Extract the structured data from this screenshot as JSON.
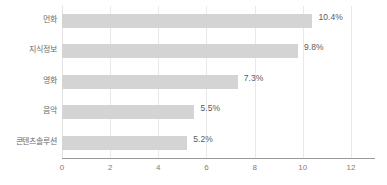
{
  "chart_data": {
    "type": "bar",
    "orientation": "horizontal",
    "title": "",
    "subtitle": "",
    "xlabel": "",
    "ylabel": "",
    "categories": [
      "먼화",
      "지식정보",
      "영화",
      "음악",
      "콘텐츠솔루션"
    ],
    "values": [
      10.4,
      9.8,
      7.3,
      5.5,
      5.2
    ],
    "data_labels": [
      "10.4%",
      "9.8%",
      "7.3%",
      "5.5%",
      "5.2%"
    ],
    "xlim": [
      0,
      13
    ],
    "xticks": [
      0,
      2,
      4,
      6,
      8,
      10,
      12
    ],
    "xtick_labels": [
      "0",
      "2",
      "4",
      "6",
      "8",
      "10",
      "12"
    ],
    "grid": true,
    "grid_axis": "x",
    "legend": false,
    "legend_position": "none",
    "colors": {
      "bar": "#d4d4d4",
      "gridline": "#e9e9e9",
      "axis": "#9a9a9a",
      "tick_text": "#7d7d7d",
      "category_text": "#6a6a6a",
      "value_text": "#5a5a5a",
      "background": "#ffffff"
    }
  }
}
